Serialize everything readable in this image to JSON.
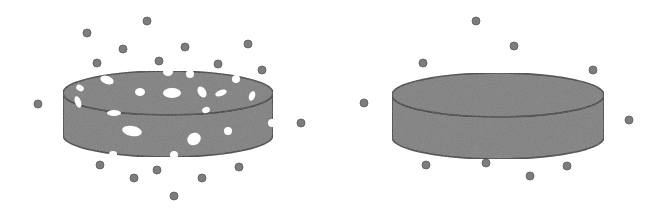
{
  "figure": {
    "colors": {
      "disc_fill": "#7a7a7a",
      "disc_stroke": "#2a2a2a",
      "particle_fill": "#7d7d7d",
      "particle_stroke": "#5a5a5a",
      "hole_fill": "#ffffff",
      "background": "#ffffff"
    },
    "left_disc": {
      "label": "porous-disc",
      "cx": 168,
      "top_cy": 93,
      "rx": 105,
      "ry": 22,
      "height": 42,
      "holes": [
        {
          "cx": 107,
          "cy": 80,
          "rx": 7,
          "ry": 4,
          "rot": 20
        },
        {
          "cx": 80,
          "cy": 88,
          "rx": 4,
          "ry": 3,
          "rot": 30
        },
        {
          "cx": 78,
          "cy": 102,
          "rx": 3,
          "ry": 6,
          "rot": -20
        },
        {
          "cx": 140,
          "cy": 92,
          "rx": 5,
          "ry": 4,
          "rot": 0
        },
        {
          "cx": 172,
          "cy": 93,
          "rx": 9,
          "ry": 5,
          "rot": 0
        },
        {
          "cx": 202,
          "cy": 92,
          "rx": 4,
          "ry": 6,
          "rot": -30
        },
        {
          "cx": 221,
          "cy": 93,
          "rx": 6,
          "ry": 3,
          "rot": -20
        },
        {
          "cx": 252,
          "cy": 96,
          "rx": 3,
          "ry": 5,
          "rot": 20
        },
        {
          "cx": 206,
          "cy": 110,
          "rx": 4,
          "ry": 3,
          "rot": -20
        },
        {
          "cx": 114,
          "cy": 113,
          "rx": 7,
          "ry": 3,
          "rot": 0
        },
        {
          "cx": 132,
          "cy": 131,
          "rx": 10,
          "ry": 5,
          "rot": 10
        },
        {
          "cx": 194,
          "cy": 139,
          "rx": 7,
          "ry": 6,
          "rot": -30
        },
        {
          "cx": 228,
          "cy": 131,
          "rx": 4,
          "ry": 4,
          "rot": 0
        },
        {
          "cx": 168,
          "cy": 72,
          "rx": 5,
          "ry": 4,
          "rot": 0
        },
        {
          "cx": 190,
          "cy": 74,
          "rx": 4,
          "ry": 4,
          "rot": 0
        },
        {
          "cx": 236,
          "cy": 79,
          "rx": 4,
          "ry": 4,
          "rot": 0
        },
        {
          "cx": 272,
          "cy": 123,
          "rx": 4,
          "ry": 4,
          "rot": 0
        },
        {
          "cx": 113,
          "cy": 154,
          "rx": 4,
          "ry": 3,
          "rot": 0
        },
        {
          "cx": 174,
          "cy": 155,
          "rx": 4,
          "ry": 4,
          "rot": 0
        }
      ]
    },
    "right_disc": {
      "label": "solid-disc",
      "cx": 498,
      "top_cy": 95,
      "rx": 106,
      "ry": 22,
      "height": 42
    },
    "left_particles": [
      [
        147,
        21
      ],
      [
        87,
        33
      ],
      [
        123,
        49
      ],
      [
        185,
        47
      ],
      [
        248,
        44
      ],
      [
        97,
        63
      ],
      [
        159,
        61
      ],
      [
        218,
        64
      ],
      [
        262,
        70
      ],
      [
        38,
        104
      ],
      [
        301,
        123
      ],
      [
        100,
        165
      ],
      [
        157,
        170
      ],
      [
        239,
        167
      ],
      [
        134,
        178
      ],
      [
        202,
        178
      ],
      [
        174,
        196
      ]
    ],
    "right_particles": [
      [
        476,
        21
      ],
      [
        514,
        46
      ],
      [
        423,
        63
      ],
      [
        593,
        70
      ],
      [
        364,
        103
      ],
      [
        629,
        120
      ],
      [
        426,
        165
      ],
      [
        486,
        163
      ],
      [
        567,
        166
      ],
      [
        530,
        176
      ]
    ],
    "particle_radius": 4
  }
}
